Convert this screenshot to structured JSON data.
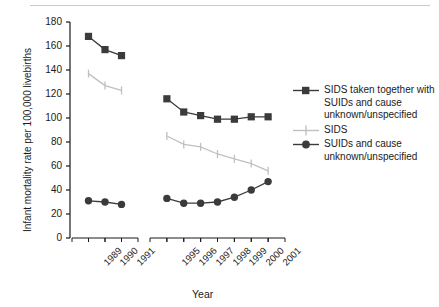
{
  "chart_data": {
    "type": "line",
    "title": "",
    "xlabel": "Year",
    "ylabel": "Infant mortality rate per 100,000 livebirths",
    "ylim": [
      0,
      180
    ],
    "ytick_labels": [
      "0",
      "20",
      "40",
      "60",
      "80",
      "100",
      "120",
      "140",
      "160",
      "180"
    ],
    "yticks": [
      0,
      20,
      40,
      60,
      80,
      100,
      120,
      140,
      160,
      180
    ],
    "grid": false,
    "legend_position": "right",
    "panels": [
      {
        "name": "panel-1989-1991",
        "categories": [
          "1989",
          "1990",
          "1991"
        ],
        "xtick_labels": [
          "1989",
          "1990",
          "1991"
        ]
      },
      {
        "name": "panel-1995-2001",
        "categories": [
          "1995",
          "1996",
          "1997",
          "1998",
          "1999",
          "2000",
          "2001"
        ],
        "xtick_labels": [
          "1995",
          "1996",
          "1997",
          "1998",
          "1999",
          "2000",
          "2001"
        ]
      }
    ],
    "series": [
      {
        "name": "SIDS taken together with SUIDs and cause unknown/unspecified",
        "legend_label": "SIDS taken together with SUIDs and cause unknown/unspecified",
        "marker": "square",
        "color": "#3b3b3b",
        "panel_values": [
          [
            168,
            157,
            152
          ],
          [
            116,
            105,
            102,
            99,
            99,
            101,
            101
          ]
        ]
      },
      {
        "name": "SIDS",
        "legend_label": "SIDS",
        "marker": "errorbar",
        "color": "#c0c0c0",
        "panel_values": [
          [
            137,
            127,
            123
          ],
          [
            85,
            78,
            76,
            70,
            66,
            62,
            56
          ]
        ],
        "errorbar_halfwidth": 4
      },
      {
        "name": "SUIDs and cause unknown/unspecified",
        "legend_label": "SUIDs and cause unknown/unspecified",
        "marker": "circle",
        "color": "#3b3b3b",
        "panel_values": [
          [
            31,
            30,
            28
          ],
          [
            33,
            29,
            29,
            30,
            34,
            40,
            47
          ]
        ]
      }
    ],
    "colors": {
      "dark_series": "#3b3b3b",
      "light_series": "#c0c0c0",
      "axis": "#1a1a1a",
      "background": "#ffffff",
      "top_rule": "#c9c9c9"
    }
  },
  "legend": {
    "items": [
      {
        "label": "SIDS taken together with SUIDs and cause unknown/unspecified",
        "key": "square-marker-key"
      },
      {
        "label": "SIDS",
        "key": "errorbar-marker-key"
      },
      {
        "label": "SUIDs and cause unknown/unspecified",
        "key": "circle-marker-key"
      }
    ]
  },
  "axes": {
    "y_title": "Infant mortality rate per 100,000 livebirths",
    "x_title": "Year"
  }
}
